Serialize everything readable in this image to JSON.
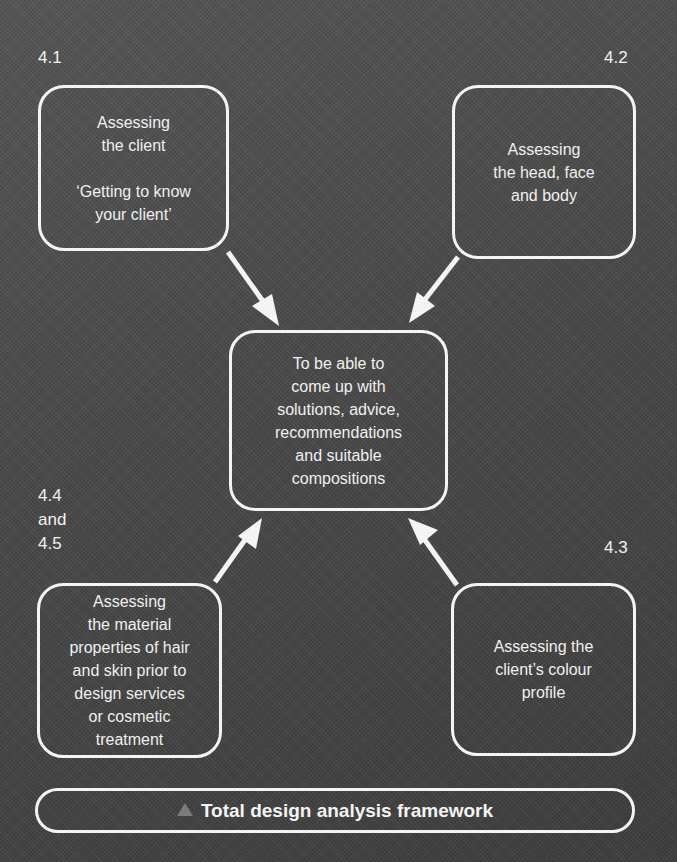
{
  "diagram": {
    "title": "Total design analysis framework",
    "title_icon": "triangle-icon",
    "colors": {
      "background": "#4a4a4a",
      "stroke": "#f4f4f4",
      "text": "#f2f2f2",
      "triangle": "#7a7a7a"
    },
    "center": {
      "text": "To be able to\ncome up with\nsolutions, advice,\nrecommendations\nand suitable\ncompositions"
    },
    "nodes": [
      {
        "id": "4.1",
        "label": "4.1",
        "text": "Assessing\nthe client\n\n‘Getting to know\nyour client’",
        "position": "top-left"
      },
      {
        "id": "4.2",
        "label": "4.2",
        "text": "Assessing\nthe head,  face\nand body",
        "position": "top-right"
      },
      {
        "id": "4.4-4.5",
        "label_lines": [
          "4.4",
          "and",
          "4.5"
        ],
        "text": "Assessing\nthe material\nproperties of hair\nand skin prior to\ndesign services\nor cosmetic\ntreatment",
        "position": "bottom-left"
      },
      {
        "id": "4.3",
        "label": "4.3",
        "text": "Assessing the\nclient’s colour\nprofile",
        "position": "bottom-right"
      }
    ],
    "edges": [
      {
        "from": "4.1",
        "to": "center"
      },
      {
        "from": "4.2",
        "to": "center"
      },
      {
        "from": "4.4-4.5",
        "to": "center"
      },
      {
        "from": "4.3",
        "to": "center"
      }
    ]
  }
}
